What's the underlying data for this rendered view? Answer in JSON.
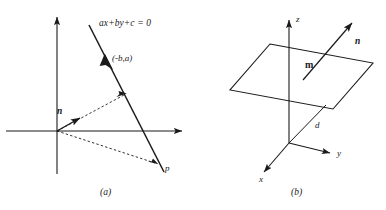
{
  "figure": {
    "stroke_color": "#1a1a1a",
    "background": "#ffffff",
    "panels": [
      {
        "id": "a",
        "caption": "(a)",
        "title": "2D line with normal vector",
        "labels": {
          "line_equation": "ax+by+c = 0",
          "direction_point": "(-b,a)",
          "normal_vector": "n",
          "point": "p"
        }
      },
      {
        "id": "b",
        "caption": "(b)",
        "title": "3D plane with normal vector",
        "labels": {
          "axis_x": "x",
          "axis_y": "y",
          "axis_z": "z",
          "normal_vector": "n",
          "plane_moment": "m",
          "distance": "d"
        }
      }
    ]
  }
}
